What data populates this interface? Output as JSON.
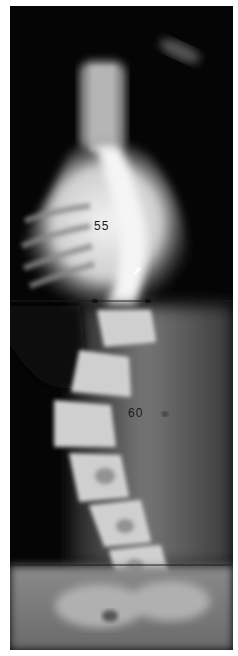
{
  "image": {
    "type": "radiograph",
    "subject": "spine x-ray showing scoliosis curves",
    "annotations": {
      "upper_curve_label": "55",
      "lower_curve_label": "60"
    },
    "colors": {
      "background": "#050505",
      "bone": "#e8e8e8",
      "soft_tissue": "#555555",
      "border": "#ffffff"
    }
  }
}
